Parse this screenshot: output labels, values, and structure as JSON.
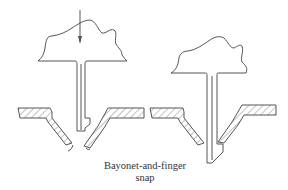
{
  "caption": {
    "line1": "Bayonet-and-finger",
    "line2": "snap"
  },
  "figures": [
    {
      "name": "before-insertion",
      "has_arrow": true,
      "arrow_direction": "down"
    },
    {
      "name": "after-snap",
      "has_arrow": false
    }
  ],
  "colors": {
    "line": "#555555",
    "background": "#ffffff",
    "text": "#333333"
  }
}
